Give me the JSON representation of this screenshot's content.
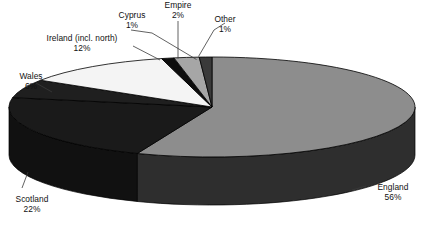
{
  "chart_data": {
    "type": "pie",
    "title": "",
    "subtitle": "",
    "xlabel": "",
    "ylabel": "",
    "legend_position": "none",
    "grid": false,
    "three_d": true,
    "value_unit": "%",
    "categories": [
      "England",
      "Scotland",
      "Ireland (incl. north)",
      "Wales",
      "Empire",
      "Cyprus",
      "Other"
    ],
    "values": [
      56,
      22,
      12,
      6,
      2,
      1,
      1
    ],
    "slices": [
      {
        "label": "England",
        "value": 56,
        "value_text": "56%",
        "color": "#8d8d8d",
        "side_color": "#2e2e2e"
      },
      {
        "label": "Scotland",
        "value": 22,
        "value_text": "22%",
        "color": "#1a1a1a",
        "side_color": "#111111"
      },
      {
        "label": "Wales",
        "value": 6,
        "value_text": "6%",
        "color": "#1f1f1f",
        "side_color": "#131313"
      },
      {
        "label": "Ireland (incl. north)",
        "value": 12,
        "value_text": "12%",
        "color": "#f4f4f4",
        "side_color": "#9a9a9a"
      },
      {
        "label": "Cyprus",
        "value": 1,
        "value_text": "1%",
        "color": "#0d0d0d",
        "side_color": "#0a0a0a"
      },
      {
        "label": "Empire",
        "value": 2,
        "value_text": "2%",
        "color": "#a6a6a6",
        "side_color": "#5a5a5a"
      },
      {
        "label": "Other",
        "value": 1,
        "value_text": "1%",
        "color": "#3a3a3a",
        "side_color": "#262626"
      }
    ],
    "colors": {
      "background": "#ffffff",
      "outline": "#000000",
      "leader_line": "#3a3a3a",
      "text": "#111111"
    }
  },
  "labels": {
    "england": {
      "name": "England",
      "value": "56%"
    },
    "scotland": {
      "name": "Scotland",
      "value": "22%"
    },
    "wales": {
      "name": "Wales",
      "value": "6%"
    },
    "ireland": {
      "name": "Ireland (incl. north)",
      "value": "12%"
    },
    "cyprus": {
      "name": "Cyprus",
      "value": "1%"
    },
    "empire": {
      "name": "Empire",
      "value": "2%"
    },
    "other": {
      "name": "Other",
      "value": "1%"
    }
  }
}
